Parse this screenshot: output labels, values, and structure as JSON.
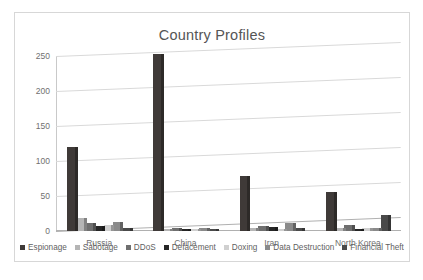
{
  "chart_data": {
    "type": "bar",
    "title": "Country Profiles",
    "xlabel": "",
    "ylabel": "",
    "ylim": [
      0,
      250
    ],
    "yticks": [
      0,
      50,
      100,
      150,
      200,
      250
    ],
    "grid": true,
    "legend_position": "bottom",
    "style": "3d-clustered-column",
    "categories": [
      "Russia",
      "China",
      "Iran",
      "North Korea"
    ],
    "series": [
      {
        "name": "Espionage",
        "color": "#3f3a38",
        "values": [
          120,
          253,
          79,
          56
        ]
      },
      {
        "name": "Sabotage",
        "color": "#b5b5b5",
        "values": [
          18,
          3,
          5,
          4
        ]
      },
      {
        "name": "DDoS",
        "color": "#6f6f6f",
        "values": [
          12,
          4,
          7,
          8
        ]
      },
      {
        "name": "Defacement",
        "color": "#262626",
        "values": [
          7,
          3,
          6,
          3
        ]
      },
      {
        "name": "Doxing",
        "color": "#d0d0d0",
        "values": [
          9,
          3,
          3,
          4
        ]
      },
      {
        "name": "Data Destruction",
        "color": "#8a8a8a",
        "values": [
          13,
          4,
          11,
          5
        ]
      },
      {
        "name": "Financial Theft",
        "color": "#4a4a4a",
        "values": [
          5,
          3,
          4,
          23
        ]
      }
    ]
  },
  "colors": {
    "frame_border": "#d7d7d7",
    "gridline": "#d9d9d9",
    "axis": "#b0b0b0",
    "title_text": "#555555",
    "tick_text": "#707070",
    "legend_text": "#5f5f5f",
    "background": "#ffffff"
  }
}
